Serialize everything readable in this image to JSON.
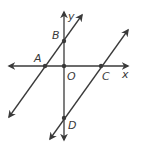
{
  "diagram": {
    "type": "coordinate-geometry",
    "colors": {
      "line": "#3a3a3a",
      "background": "#ffffff"
    },
    "axes": {
      "x_label": "x",
      "y_label": "y",
      "origin_label": "O"
    },
    "points": [
      {
        "id": "A",
        "label": "A",
        "on": "x-axis",
        "position": "negative x-axis"
      },
      {
        "id": "O",
        "label": "O",
        "on": "origin",
        "position": "origin"
      },
      {
        "id": "C",
        "label": "C",
        "on": "x-axis",
        "position": "positive x-axis"
      },
      {
        "id": "B",
        "label": "B",
        "on": "y-axis",
        "position": "positive y-axis"
      },
      {
        "id": "D",
        "label": "D",
        "on": "y-axis",
        "position": "negative y-axis"
      }
    ],
    "lines": [
      {
        "id": "AB",
        "through": [
          "A",
          "B"
        ],
        "note": "line through A and B"
      },
      {
        "id": "CD",
        "through": [
          "C",
          "D"
        ],
        "note": "line through C and D, parallel to AB"
      }
    ]
  }
}
